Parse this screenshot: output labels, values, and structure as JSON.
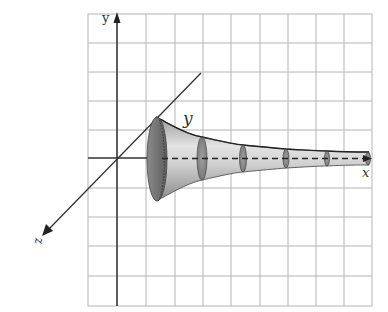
{
  "figure": {
    "axes": {
      "x_label": "x",
      "y_label": "y",
      "z_label": "z",
      "curve_label": "y"
    },
    "grid": {
      "columns": 10,
      "rows": 10,
      "color": "#b0b0b0"
    },
    "colors": {
      "axis": "#333333",
      "horn_dark": "#6e6e6e",
      "horn_light": "#dcdcdc",
      "background": "#ffffff"
    },
    "cross_sections": 5
  }
}
